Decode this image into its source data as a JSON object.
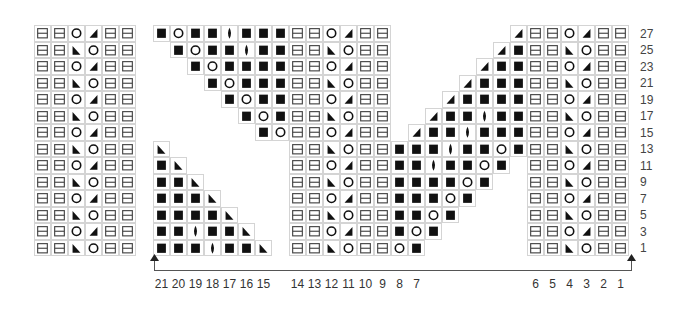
{
  "legend_codes": {
    "B": "filled-square",
    "O": "circle",
    "D": "lens",
    "L": "triangle-left",
    "R": "triangle-right",
    "H": "split-box",
    ".": "empty"
  },
  "left_panel": {
    "rows": [
      "HHORHH",
      "HHLOHH",
      "HHORHH",
      "HHLOHH",
      "HHORHH",
      "HHLOHH",
      "HHORHH",
      "HHLOHH",
      "HHORHH",
      "HHLOHH",
      "HHORHH",
      "HHLOHH",
      "HHORHH",
      "HHLOHH"
    ]
  },
  "main_chart": {
    "rows": [
      "BOBBDBBBHHORHH.......RHHORHH",
      ".BOBBDBBHHLOHH......RBHHLOHH",
      "..BOBBBBHHORHH.....RBBHHORHH",
      "...BOBBBHHLOHH....RBBBHHLOHH",
      "....BOBBHHORHH...RBBBBHHORHH",
      ".....BOBHHLOHH..RBBDBBHHLOHH",
      "......BOHHORHH.RBBDBBBHHORHH",
      "L.......HHLOHHBBBDBBOBHHLOHH",
      "BL......HHORHHBBDBBOB.HHORHH",
      "BBL.....HHLOHHBBBBOB..HHLOHH",
      "BBBL....HHORHHBBBOB...HHORHH",
      "BBBBL...HHLOHHBBOB....HHLOHH",
      "BBDBBL..HHORHHBOB.....HHORHH",
      "BBBDBBL.HHLOHHOB......HHLOHH"
    ]
  },
  "row_numbers": [
    "27",
    "25",
    "23",
    "21",
    "19",
    "17",
    "15",
    "13",
    "11",
    "9",
    "7",
    "5",
    "3",
    "1"
  ],
  "column_numbers": [
    {
      "label": "21",
      "col": 0
    },
    {
      "label": "20",
      "col": 1
    },
    {
      "label": "19",
      "col": 2
    },
    {
      "label": "18",
      "col": 3
    },
    {
      "label": "17",
      "col": 4
    },
    {
      "label": "16",
      "col": 5
    },
    {
      "label": "15",
      "col": 6
    },
    {
      "label": "14",
      "col": 8
    },
    {
      "label": "13",
      "col": 9
    },
    {
      "label": "12",
      "col": 10
    },
    {
      "label": "11",
      "col": 11
    },
    {
      "label": "10",
      "col": 12
    },
    {
      "label": "9",
      "col": 13
    },
    {
      "label": "8",
      "col": 14
    },
    {
      "label": "7",
      "col": 15
    },
    {
      "label": "6",
      "col": 22
    },
    {
      "label": "5",
      "col": 23
    },
    {
      "label": "4",
      "col": 24
    },
    {
      "label": "3",
      "col": 25
    },
    {
      "label": "2",
      "col": 26
    },
    {
      "label": "1",
      "col": 27
    }
  ],
  "colors": {
    "ink": "#111111",
    "grid": "#d4d4d4",
    "box": "#444444"
  }
}
